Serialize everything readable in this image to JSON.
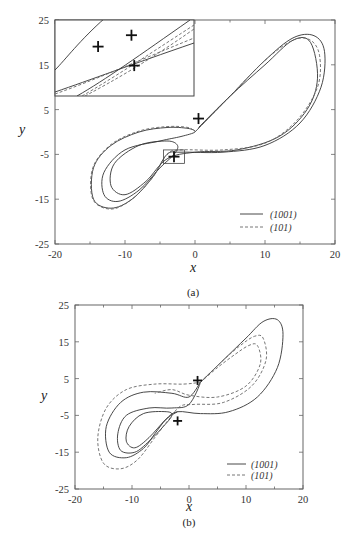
{
  "chart_data": [
    {
      "id": "a",
      "type": "line",
      "caption": "(a)",
      "xlabel": "x",
      "ylabel": "y",
      "xlim": [
        -20,
        20
      ],
      "ylim": [
        -25,
        25
      ],
      "xticks": [
        -20,
        -10,
        0,
        10,
        20
      ],
      "yticks": [
        -25,
        -15,
        -5,
        5,
        15,
        25
      ],
      "grid": false,
      "legend": {
        "position": "lower right",
        "entries": [
          {
            "label": "(1001)",
            "style": "solid"
          },
          {
            "label": "(101)",
            "style": "dashed"
          }
        ]
      },
      "series": [
        {
          "name": "(1001)",
          "style": "solid",
          "points": [
            [
              0,
              0
            ],
            [
              5,
              8
            ],
            [
              10,
              16
            ],
            [
              14,
              21
            ],
            [
              17,
              21.5
            ],
            [
              18.5,
              18
            ],
            [
              18,
              10
            ],
            [
              15,
              2
            ],
            [
              10,
              -3
            ],
            [
              4,
              -4.5
            ],
            [
              -2,
              -4.5
            ],
            [
              -4,
              -5
            ],
            [
              -6,
              -10
            ],
            [
              -9,
              -15
            ],
            [
              -12,
              -17
            ],
            [
              -14.5,
              -15
            ],
            [
              -14.5,
              -8
            ],
            [
              -12,
              -3
            ],
            [
              -8,
              0
            ],
            [
              -4,
              1
            ],
            [
              -1,
              0.8
            ],
            [
              0,
              0
            ],
            [
              -2,
              -1
            ],
            [
              -5,
              -2
            ],
            [
              -10,
              -4
            ],
            [
              -13,
              -9
            ],
            [
              -13,
              -14
            ],
            [
              -11,
              -15.5
            ],
            [
              -8,
              -13
            ],
            [
              -5,
              -8
            ],
            [
              -3,
              -5
            ],
            [
              -2.5,
              -3
            ],
            [
              -4,
              -2
            ],
            [
              -8,
              -3
            ],
            [
              -11.5,
              -7
            ],
            [
              -12,
              -12
            ],
            [
              -10,
              -14
            ],
            [
              -7,
              -11
            ],
            [
              -4,
              -6
            ],
            [
              0,
              -4.5
            ],
            [
              6,
              -4
            ],
            [
              12,
              -1
            ],
            [
              16,
              5
            ],
            [
              17.5,
              12
            ],
            [
              16.5,
              20
            ],
            [
              14,
              20.5
            ],
            [
              10,
              15
            ],
            [
              5,
              8
            ],
            [
              0.5,
              1
            ]
          ]
        },
        {
          "name": "(101)",
          "style": "dashed",
          "points": [
            [
              0,
              0
            ],
            [
              5,
              8
            ],
            [
              10,
              16
            ],
            [
              14,
              20.5
            ],
            [
              16.5,
              20.5
            ],
            [
              17.8,
              17
            ],
            [
              17.5,
              10
            ],
            [
              14.5,
              2.5
            ],
            [
              10,
              -2.5
            ],
            [
              4,
              -4
            ],
            [
              -2,
              -4
            ],
            [
              -4,
              -5
            ],
            [
              -6,
              -10
            ],
            [
              -9,
              -15
            ],
            [
              -12,
              -17.2
            ],
            [
              -14.6,
              -15
            ],
            [
              -14.6,
              -8
            ],
            [
              -12,
              -2.8
            ],
            [
              -8,
              0.2
            ],
            [
              -4,
              1.2
            ],
            [
              -1,
              1
            ],
            [
              0,
              0
            ]
          ]
        }
      ],
      "markers": [
        {
          "type": "plus",
          "x": 0.5,
          "y": 3
        },
        {
          "type": "plus",
          "x": -3.0,
          "y": -5.5
        }
      ],
      "zoom_box": {
        "x0": -4.5,
        "x1": -1.5,
        "y0": -7,
        "y1": -4
      },
      "inset": {
        "description": "magnified view of zoom box region",
        "markers": [
          {
            "type": "plus",
            "u": 0.31,
            "v": 0.35
          },
          {
            "type": "plus",
            "u": 0.55,
            "v": 0.2
          },
          {
            "type": "plus",
            "u": 0.57,
            "v": 0.6
          }
        ]
      }
    },
    {
      "id": "b",
      "type": "line",
      "caption": "(b)",
      "xlabel": "x",
      "ylabel": "y",
      "xlim": [
        -20,
        20
      ],
      "ylim": [
        -25,
        25
      ],
      "xticks": [
        -20,
        -10,
        0,
        10,
        20
      ],
      "yticks": [
        -25,
        -15,
        -5,
        5,
        15,
        25
      ],
      "grid": false,
      "legend": {
        "position": "lower right",
        "entries": [
          {
            "label": "(1001)",
            "style": "solid"
          },
          {
            "label": "(101)",
            "style": "dashed"
          }
        ]
      },
      "series": [
        {
          "name": "(1001)",
          "style": "solid",
          "points": [
            [
              2,
              4
            ],
            [
              6,
              10
            ],
            [
              10,
              16
            ],
            [
              13,
              20.5
            ],
            [
              15.5,
              21
            ],
            [
              16.5,
              17
            ],
            [
              15.5,
              8
            ],
            [
              12,
              0
            ],
            [
              7,
              -4
            ],
            [
              2,
              -4.5
            ],
            [
              -2,
              -4
            ],
            [
              -4,
              -6
            ],
            [
              -6,
              -10
            ],
            [
              -8,
              -14
            ],
            [
              -11,
              -16.5
            ],
            [
              -14,
              -15
            ],
            [
              -14.5,
              -8
            ],
            [
              -12,
              -1.5
            ],
            [
              -8,
              1.3
            ],
            [
              -3,
              1
            ],
            [
              0,
              0
            ],
            [
              2,
              4
            ],
            [
              0,
              -2
            ],
            [
              -3,
              -3
            ],
            [
              -7,
              -3
            ],
            [
              -11,
              -5
            ],
            [
              -12.5,
              -10
            ],
            [
              -12,
              -14.5
            ],
            [
              -9.5,
              -15
            ],
            [
              -7,
              -12
            ],
            [
              -4.5,
              -8
            ],
            [
              -3,
              -5
            ],
            [
              -4,
              -4
            ],
            [
              -8,
              -4.5
            ],
            [
              -10.5,
              -8
            ],
            [
              -11,
              -12
            ],
            [
              -9.5,
              -13.8
            ],
            [
              -7,
              -11
            ],
            [
              -4,
              -6
            ],
            [
              -2,
              -4
            ]
          ]
        },
        {
          "name": "(101)",
          "style": "dashed",
          "points": [
            [
              2,
              4
            ],
            [
              6,
              10
            ],
            [
              9,
              14
            ],
            [
              11.5,
              16.5
            ],
            [
              13,
              16
            ],
            [
              13.5,
              10
            ],
            [
              11,
              3
            ],
            [
              6,
              -1.5
            ],
            [
              1,
              -2
            ],
            [
              -1.5,
              -2.5
            ],
            [
              -3.5,
              -6
            ],
            [
              -6,
              -11
            ],
            [
              -9,
              -17
            ],
            [
              -12,
              -19.5
            ],
            [
              -15,
              -18
            ],
            [
              -16,
              -11
            ],
            [
              -14.5,
              -3
            ],
            [
              -11,
              2
            ],
            [
              -6,
              3.5
            ],
            [
              -1,
              3.5
            ],
            [
              2,
              4
            ]
          ]
        },
        {
          "name": "(101)-inner",
          "style": "dashed",
          "points": [
            [
              2,
              4
            ],
            [
              5,
              8
            ],
            [
              8,
              11.5
            ],
            [
              10.5,
              14
            ],
            [
              12,
              14
            ],
            [
              12.5,
              9
            ],
            [
              10,
              3
            ],
            [
              5,
              0
            ],
            [
              0,
              0.5
            ],
            [
              -3,
              2
            ],
            [
              -6,
              1
            ]
          ]
        }
      ],
      "markers": [
        {
          "type": "plus",
          "x": 1.5,
          "y": 4.5
        },
        {
          "type": "plus",
          "x": -2.0,
          "y": -6.5
        }
      ]
    }
  ]
}
